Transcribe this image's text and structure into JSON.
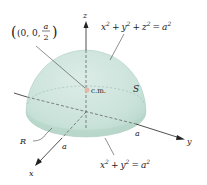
{
  "figure": {
    "type": "hemisphere-center-of-mass",
    "colors": {
      "surface": "#c9e2d9",
      "surface_dark": "#b2d2c6",
      "surface_light": "#dcece6",
      "axis": "#222222",
      "cm_dot": "#e3b8a6"
    },
    "labels": {
      "point": {
        "open": "(0, 0, ",
        "num": "a",
        "den": "2",
        "close": ")"
      },
      "sphere_eq": {
        "x": "x",
        "y": "y",
        "z": "z",
        "a": "a",
        "exp": "2",
        "plus": "+",
        "eq": "="
      },
      "disk_eq": {
        "x": "x",
        "y": "y",
        "a": "a",
        "exp": "2",
        "plus": "+",
        "eq": "="
      },
      "cm": "c.m.",
      "surface": "S",
      "region": "R",
      "radius_x": "a",
      "radius_y": "a",
      "axis_x": "x",
      "axis_y": "y",
      "axis_z": "z"
    }
  }
}
